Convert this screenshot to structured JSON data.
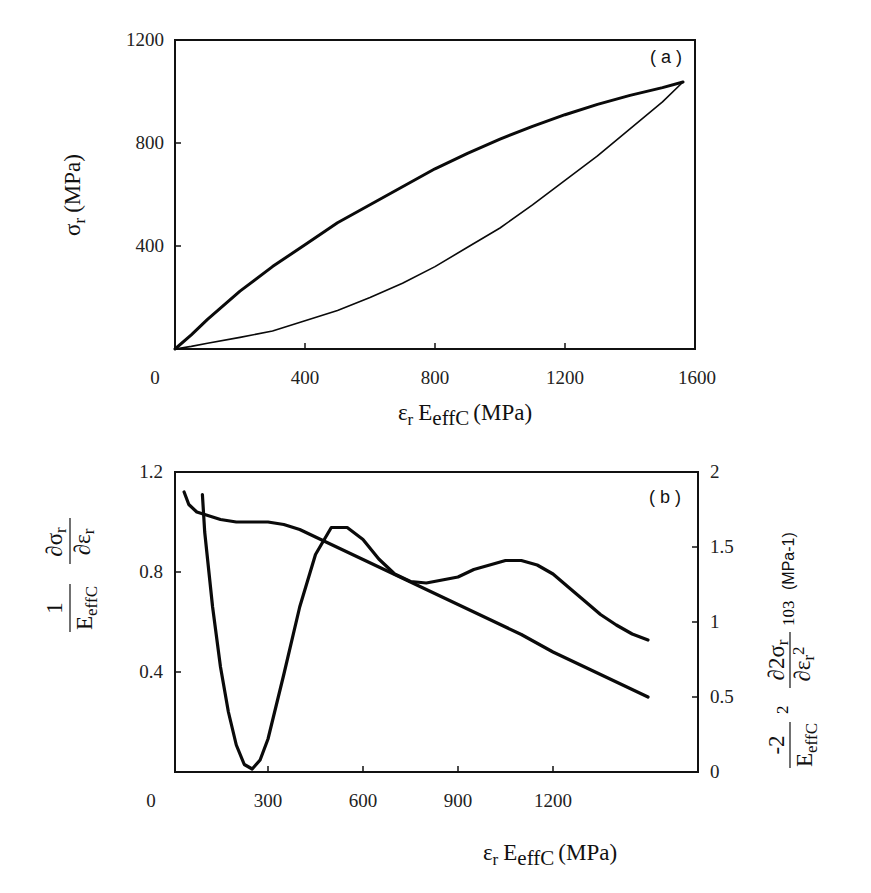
{
  "chart_data": [
    {
      "panel": "a",
      "type": "line",
      "panel_label": "( a )",
      "xlabel": "εr EeffC (MPa)",
      "xlabel_parts": {
        "sym": "ε",
        "sym_sub": "r",
        "E": "E",
        "E_sub": "effC",
        "unit": "(MPa)"
      },
      "ylabel": "σr (MPa)",
      "ylabel_parts": {
        "sym": "σ",
        "sym_sub": "r",
        "unit": "(MPa)"
      },
      "xlim": [
        0,
        1600
      ],
      "ylim": [
        0,
        1200
      ],
      "x_ticks": [
        "0",
        "400",
        "800",
        "1200",
        "1600"
      ],
      "y_ticks": [
        "400",
        "800",
        "1200"
      ],
      "grid": false,
      "series": [
        {
          "name": "loading (thick, two overlapping traces)",
          "x": [
            0,
            50,
            100,
            200,
            300,
            400,
            500,
            600,
            700,
            800,
            900,
            1000,
            1100,
            1200,
            1300,
            1400,
            1500,
            1563
          ],
          "y": [
            0,
            55,
            115,
            225,
            320,
            405,
            490,
            560,
            630,
            700,
            760,
            815,
            865,
            910,
            950,
            985,
            1015,
            1037
          ]
        },
        {
          "name": "unloading (thin)",
          "x": [
            1563,
            1500,
            1400,
            1300,
            1200,
            1100,
            1000,
            900,
            800,
            700,
            600,
            500,
            400,
            300,
            200,
            100,
            50,
            0
          ],
          "y": [
            1037,
            960,
            855,
            750,
            655,
            560,
            470,
            395,
            320,
            255,
            200,
            150,
            110,
            70,
            45,
            22,
            10,
            0
          ]
        }
      ]
    },
    {
      "panel": "b",
      "type": "line",
      "panel_label": "( b )",
      "xlabel": "εr EeffC (MPa)",
      "xlabel_parts": {
        "sym": "ε",
        "sym_sub": "r",
        "E": "E",
        "E_sub": "effC",
        "unit": "(MPa)"
      },
      "ylabel_left": "(1/EeffC) ∂σr/∂εr",
      "ylabel_left_parts": {
        "num": "1",
        "den": "E",
        "den_sub": "effC",
        "dnum": "∂σ",
        "dnum_sub": "r",
        "dden": "∂ε",
        "dden_sub": "r"
      },
      "ylabel_right": "(-2/EeffC²) ∂²σr/∂εr² 10³ (MPa-1)",
      "ylabel_right_parts": {
        "num": "-2",
        "den": "E",
        "den_sub": "effC",
        "den_sup": "2",
        "dnum": "∂2σ",
        "dnum_sub": "r",
        "dden": "∂ε",
        "dden_sub": "r",
        "dden_sup": "2",
        "factor": "103",
        "unit": "(MPa-1)"
      },
      "xlim": [
        0,
        1650
      ],
      "ylim_left": [
        0,
        1.2
      ],
      "ylim_right": [
        0,
        2
      ],
      "x_ticks": [
        "0",
        "300",
        "600",
        "900",
        "1200"
      ],
      "y_ticks_left": [
        "0.4",
        "0.8",
        "1.2"
      ],
      "y_ticks_right": [
        "0",
        "0.5",
        "1",
        "1.5",
        "2"
      ],
      "grid": false,
      "series": [
        {
          "name": "normalized tangent modulus (left axis)",
          "axis": "left",
          "x": [
            35,
            50,
            75,
            100,
            150,
            200,
            300,
            350,
            400,
            450,
            500,
            600,
            700,
            800,
            900,
            1000,
            1100,
            1200,
            1300,
            1500
          ],
          "y": [
            1.12,
            1.07,
            1.04,
            1.03,
            1.01,
            1.0,
            1.0,
            0.99,
            0.97,
            0.94,
            0.91,
            0.85,
            0.79,
            0.73,
            0.67,
            0.61,
            0.55,
            0.48,
            0.42,
            0.3
          ]
        },
        {
          "name": "normalized second derivative x10^3 (right axis)",
          "axis": "right",
          "x": [
            93,
            100,
            125,
            150,
            175,
            200,
            225,
            250,
            275,
            300,
            350,
            400,
            450,
            500,
            550,
            600,
            650,
            700,
            750,
            800,
            850,
            900,
            950,
            1000,
            1050,
            1100,
            1150,
            1200,
            1250,
            1300,
            1350,
            1400,
            1450,
            1500
          ],
          "y": [
            1.85,
            1.6,
            1.1,
            0.7,
            0.4,
            0.18,
            0.05,
            0.02,
            0.08,
            0.22,
            0.65,
            1.1,
            1.45,
            1.63,
            1.63,
            1.55,
            1.42,
            1.32,
            1.27,
            1.26,
            1.28,
            1.3,
            1.35,
            1.38,
            1.41,
            1.41,
            1.38,
            1.32,
            1.23,
            1.14,
            1.05,
            0.98,
            0.92,
            0.88
          ]
        }
      ]
    }
  ]
}
